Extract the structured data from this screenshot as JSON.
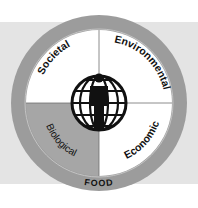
{
  "diagram": {
    "center_label": "FOOD",
    "quadrants": [
      {
        "id": "societal",
        "label": "Societal",
        "fill": "#ffffff"
      },
      {
        "id": "environmental",
        "label": "Environmental",
        "fill": "#ffffff"
      },
      {
        "id": "economic",
        "label": "Economic",
        "fill": "#ffffff"
      },
      {
        "id": "biological",
        "label": "Biological",
        "fill": "#a6a6a6"
      }
    ],
    "center_icon": "person-in-globe-icon",
    "colors": {
      "outer_ring": "#9c9c9c",
      "background_band": "#e4e4e4",
      "highlight_quadrant": "#a6a6a6",
      "divider": "#6e6e6e",
      "icon": "#111111"
    }
  }
}
